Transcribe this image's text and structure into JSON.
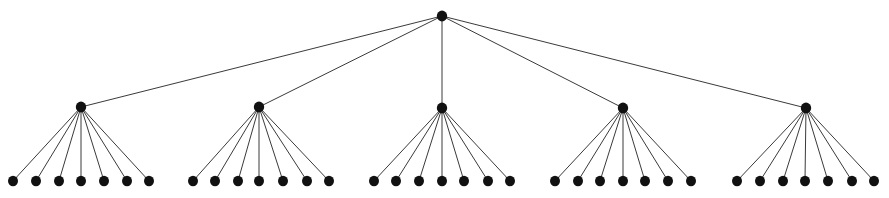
{
  "figure": {
    "kind": "rooted-tree-diagram",
    "width": 889,
    "height": 198,
    "background_color": "#ffffff",
    "edge_color": "#3a3a3a",
    "edge_width": 1,
    "node_color": "#111111",
    "title": "",
    "caption": ""
  },
  "graph": {
    "type": "tree",
    "depth": 3,
    "root_children_count": 5,
    "internal_children_count": 7,
    "node_count": 41,
    "edge_count": 40,
    "levels": [
      {
        "name": "root",
        "level": 0,
        "y": 16,
        "radius": 5.2,
        "count": 1,
        "nodes": [
          {
            "id": "r",
            "x": 442,
            "y": 16
          }
        ]
      },
      {
        "name": "branch",
        "level": 1,
        "y": 107,
        "radius": 5.2,
        "count": 5,
        "nodes": [
          {
            "id": "b1",
            "x": 81,
            "y": 107
          },
          {
            "id": "b2",
            "x": 259,
            "y": 107
          },
          {
            "id": "b3",
            "x": 442,
            "y": 108
          },
          {
            "id": "b4",
            "x": 623,
            "y": 108
          },
          {
            "id": "b5",
            "x": 806,
            "y": 108
          }
        ]
      },
      {
        "name": "leaf",
        "level": 2,
        "y": 181,
        "radius": 5.0,
        "count": 35,
        "nodes": [
          {
            "id": "l1-1",
            "x": 13,
            "y": 181,
            "parent": "b1"
          },
          {
            "id": "l1-2",
            "x": 36,
            "y": 181,
            "parent": "b1"
          },
          {
            "id": "l1-3",
            "x": 59,
            "y": 181,
            "parent": "b1"
          },
          {
            "id": "l1-4",
            "x": 81,
            "y": 181,
            "parent": "b1"
          },
          {
            "id": "l1-5",
            "x": 104,
            "y": 181,
            "parent": "b1"
          },
          {
            "id": "l1-6",
            "x": 127,
            "y": 181,
            "parent": "b1"
          },
          {
            "id": "l1-7",
            "x": 149,
            "y": 181,
            "parent": "b1"
          },
          {
            "id": "l2-1",
            "x": 193,
            "y": 181,
            "parent": "b2"
          },
          {
            "id": "l2-2",
            "x": 215,
            "y": 181,
            "parent": "b2"
          },
          {
            "id": "l2-3",
            "x": 238,
            "y": 181,
            "parent": "b2"
          },
          {
            "id": "l2-4",
            "x": 259,
            "y": 181,
            "parent": "b2"
          },
          {
            "id": "l2-5",
            "x": 283,
            "y": 181,
            "parent": "b2"
          },
          {
            "id": "l2-6",
            "x": 307,
            "y": 181,
            "parent": "b2"
          },
          {
            "id": "l2-7",
            "x": 329,
            "y": 181,
            "parent": "b2"
          },
          {
            "id": "l3-1",
            "x": 374,
            "y": 181,
            "parent": "b3"
          },
          {
            "id": "l3-2",
            "x": 396,
            "y": 181,
            "parent": "b3"
          },
          {
            "id": "l3-3",
            "x": 419,
            "y": 181,
            "parent": "b3"
          },
          {
            "id": "l3-4",
            "x": 442,
            "y": 181,
            "parent": "b3"
          },
          {
            "id": "l3-5",
            "x": 464,
            "y": 181,
            "parent": "b3"
          },
          {
            "id": "l3-6",
            "x": 488,
            "y": 181,
            "parent": "b3"
          },
          {
            "id": "l3-7",
            "x": 510,
            "y": 181,
            "parent": "b3"
          },
          {
            "id": "l4-1",
            "x": 555,
            "y": 181,
            "parent": "b4"
          },
          {
            "id": "l4-2",
            "x": 578,
            "y": 181,
            "parent": "b4"
          },
          {
            "id": "l4-3",
            "x": 600,
            "y": 181,
            "parent": "b4"
          },
          {
            "id": "l4-4",
            "x": 623,
            "y": 181,
            "parent": "b4"
          },
          {
            "id": "l4-5",
            "x": 645,
            "y": 181,
            "parent": "b4"
          },
          {
            "id": "l4-6",
            "x": 668,
            "y": 181,
            "parent": "b4"
          },
          {
            "id": "l4-7",
            "x": 691,
            "y": 181,
            "parent": "b4"
          },
          {
            "id": "l5-1",
            "x": 737,
            "y": 181,
            "parent": "b5"
          },
          {
            "id": "l5-2",
            "x": 760,
            "y": 181,
            "parent": "b5"
          },
          {
            "id": "l5-3",
            "x": 783,
            "y": 181,
            "parent": "b5"
          },
          {
            "id": "l5-4",
            "x": 805,
            "y": 181,
            "parent": "b5"
          },
          {
            "id": "l5-5",
            "x": 828,
            "y": 181,
            "parent": "b5"
          },
          {
            "id": "l5-6",
            "x": 852,
            "y": 181,
            "parent": "b5"
          },
          {
            "id": "l5-7",
            "x": 874,
            "y": 181,
            "parent": "b5"
          }
        ]
      }
    ],
    "edges": [
      {
        "from": "r",
        "to": "b1"
      },
      {
        "from": "r",
        "to": "b2"
      },
      {
        "from": "r",
        "to": "b3"
      },
      {
        "from": "r",
        "to": "b4"
      },
      {
        "from": "r",
        "to": "b5"
      }
    ]
  }
}
